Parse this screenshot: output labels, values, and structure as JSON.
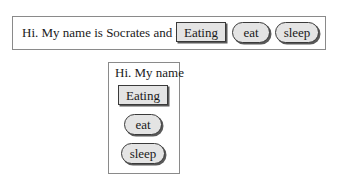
{
  "horizontal_panel": {
    "label": "Hi. My name is Socrates and I am",
    "buttons": [
      {
        "label": "Eating",
        "shape": "rectangle"
      },
      {
        "label": "eat",
        "shape": "pill"
      },
      {
        "label": "sleep",
        "shape": "pill"
      }
    ]
  },
  "vertical_panel": {
    "label": "Hi. My name",
    "buttons": [
      {
        "label": "Eating",
        "shape": "rectangle"
      },
      {
        "label": "eat",
        "shape": "pill"
      },
      {
        "label": "sleep",
        "shape": "pill"
      }
    ]
  },
  "colors": {
    "button_fill": "#e4e4e4",
    "button_border": "#3a3a3a",
    "panel_border": "#8a8a8a",
    "background": "#ffffff"
  }
}
